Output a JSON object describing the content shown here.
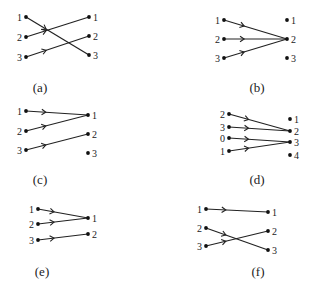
{
  "figure": {
    "panels": [
      {
        "caption": "(a)",
        "left_nodes": [
          "1",
          "2",
          "3"
        ],
        "right_nodes": [
          "1",
          "2",
          "3"
        ],
        "edges": [
          {
            "from": "1",
            "to": "3",
            "arrow": true
          },
          {
            "from": "2",
            "to": "1",
            "arrow": true
          },
          {
            "from": "3",
            "to": "2",
            "arrow": true
          }
        ]
      },
      {
        "caption": "(b)",
        "left_nodes": [
          "1",
          "2",
          "3"
        ],
        "right_nodes": [
          "1",
          "2",
          "3"
        ],
        "edges": [
          {
            "from": "1",
            "to": "2",
            "arrow": true
          },
          {
            "from": "2",
            "to": "2",
            "arrow": true
          },
          {
            "from": "3",
            "to": "2",
            "arrow": true
          }
        ]
      },
      {
        "caption": "(c)",
        "left_nodes": [
          "1",
          "2",
          "3"
        ],
        "right_nodes": [
          "1",
          "2",
          "3"
        ],
        "edges": [
          {
            "from": "1",
            "to": "1",
            "arrow": true
          },
          {
            "from": "2",
            "to": "1",
            "arrow": true
          },
          {
            "from": "3",
            "to": "2",
            "arrow": true
          }
        ]
      },
      {
        "caption": "(d)",
        "left_nodes": [
          "2",
          "3",
          "0",
          "1"
        ],
        "right_nodes": [
          "1",
          "2",
          "3",
          "4"
        ],
        "edges": [
          {
            "from": "2",
            "to": "2",
            "arrow": true
          },
          {
            "from": "3",
            "to": "2",
            "arrow": true
          },
          {
            "from": "0",
            "to": "3",
            "arrow": true
          },
          {
            "from": "1",
            "to": "3",
            "arrow": true
          }
        ]
      },
      {
        "caption": "(e)",
        "left_nodes": [
          "1",
          "2",
          "3"
        ],
        "right_nodes": [
          "1",
          "2"
        ],
        "edges": [
          {
            "from": "1",
            "to": "1",
            "arrow": true
          },
          {
            "from": "2",
            "to": "1",
            "arrow": true
          },
          {
            "from": "3",
            "to": "2",
            "arrow": true
          }
        ]
      },
      {
        "caption": "(f)",
        "left_nodes": [
          "1",
          "2",
          "3"
        ],
        "right_nodes": [
          "1",
          "2",
          "3"
        ],
        "edges": [
          {
            "from": "1",
            "to": "1",
            "arrow": true
          },
          {
            "from": "2",
            "to": "3",
            "arrow": true
          },
          {
            "from": "3",
            "to": "2",
            "arrow": true
          }
        ]
      }
    ]
  }
}
